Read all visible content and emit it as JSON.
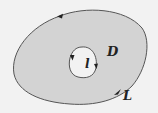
{
  "diagram": {
    "colors": {
      "background": "#f2f2f2",
      "region_fill": "#d3d3d3",
      "stroke": "#555555",
      "text": "#222222"
    },
    "labels": {
      "region": "D",
      "inner_curve": "l",
      "outer_curve": "L"
    },
    "arrows": {
      "outer": "counterclockwise",
      "inner": "clockwise"
    }
  }
}
